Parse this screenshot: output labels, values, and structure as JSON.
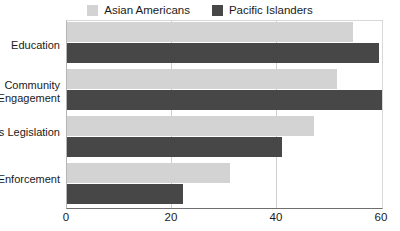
{
  "legend": {
    "position": "top-center",
    "items": [
      {
        "label": "Asian Americans",
        "color": "#d3d3d3",
        "swatch_name": "legend-swatch-asian-americans"
      },
      {
        "label": "Pacific Islanders",
        "color": "#474747",
        "swatch_name": "legend-swatch-pacific-islanders"
      }
    ]
  },
  "axis": {
    "x_ticks": [
      "0",
      "20",
      "40",
      "60"
    ]
  },
  "chart_data": {
    "type": "bar",
    "orientation": "horizontal",
    "title": "",
    "xlabel": "",
    "ylabel": "",
    "xlim": [
      0,
      60
    ],
    "ylim": null,
    "grid": true,
    "grid_axis": "x",
    "legend_position": "top-center",
    "categories": [
      "Education",
      "Community Engagement",
      "Civil Rights Legislation",
      "More Law Enforcement"
    ],
    "xticks": [
      0,
      20,
      40,
      60
    ],
    "series": [
      {
        "name": "Asian Americans",
        "color": "#d3d3d3",
        "values": [
          54.5,
          51.5,
          47,
          31
        ]
      },
      {
        "name": "Pacific Islanders",
        "color": "#474747",
        "values": [
          59.5,
          60,
          41,
          22
        ]
      }
    ]
  }
}
